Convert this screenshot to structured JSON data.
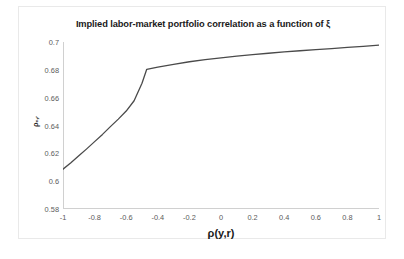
{
  "chart_data": {
    "type": "line",
    "title": "Implied labor-market portfolio correlation as a function of ξ",
    "xlabel": "ρ(y,r)",
    "ylabel": "ρₑ,ᵣ",
    "xlim": [
      -1,
      1
    ],
    "ylim": [
      0.58,
      0.7
    ],
    "xticks": [
      "-1",
      "-0.8",
      "-0.6",
      "-0.4",
      "-0.2",
      "0",
      "0.2",
      "0.4",
      "0.6",
      "0.8",
      "1"
    ],
    "xtick_values": [
      -1,
      -0.8,
      -0.6,
      -0.4,
      -0.2,
      0,
      0.2,
      0.4,
      0.6,
      0.8,
      1
    ],
    "yticks": [
      "0.58",
      "0.6",
      "0.62",
      "0.64",
      "0.66",
      "0.68",
      "0.7"
    ],
    "ytick_values": [
      0.58,
      0.6,
      0.62,
      0.64,
      0.66,
      0.68,
      0.7
    ],
    "grid": false,
    "legend": "none",
    "line_color": "#4a4a4a",
    "series": [
      {
        "name": "implied correlation",
        "x": [
          -1.0,
          -0.95,
          -0.9,
          -0.85,
          -0.8,
          -0.75,
          -0.7,
          -0.65,
          -0.6,
          -0.55,
          -0.5,
          -0.47,
          -0.4,
          -0.3,
          -0.2,
          -0.1,
          0.0,
          0.1,
          0.2,
          0.3,
          0.4,
          0.5,
          0.6,
          0.7,
          0.8,
          0.9,
          1.0
        ],
        "values": [
          0.6086,
          0.6132,
          0.6182,
          0.6232,
          0.6284,
          0.6336,
          0.6392,
          0.6446,
          0.6504,
          0.6578,
          0.6704,
          0.6804,
          0.682,
          0.684,
          0.6858,
          0.6873,
          0.6886,
          0.6898,
          0.6909,
          0.6919,
          0.6929,
          0.6937,
          0.6945,
          0.6953,
          0.6961,
          0.6969,
          0.6978
        ]
      }
    ]
  }
}
